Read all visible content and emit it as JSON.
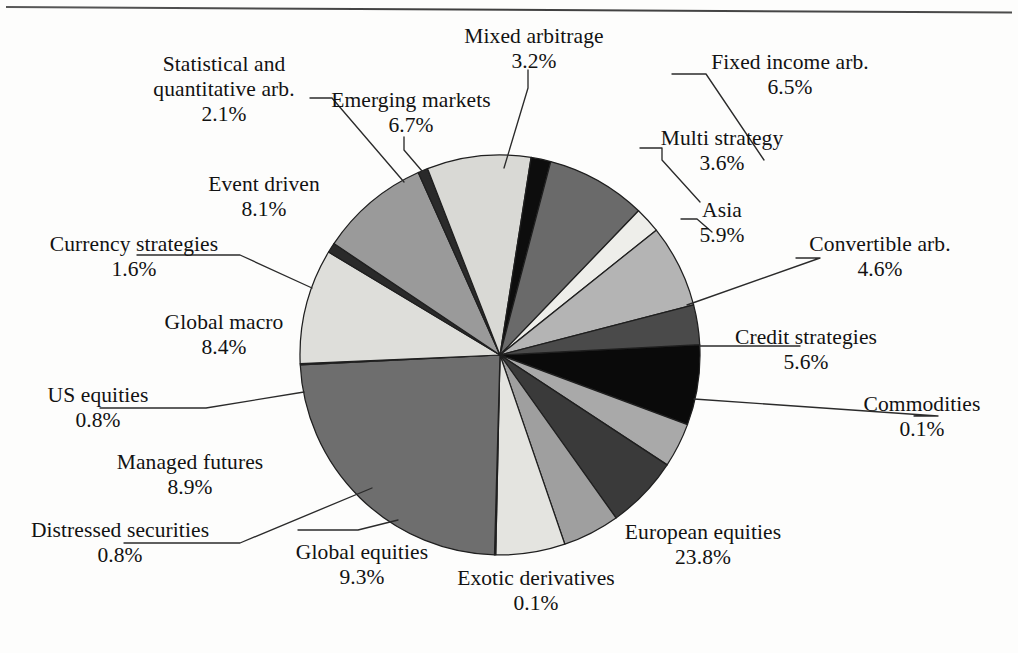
{
  "figure": {
    "type": "pie",
    "background_color": "#fdfdfc",
    "pie_center": [
      500,
      355
    ],
    "pie_radius": 200,
    "has_top_rule": true
  },
  "chart_data": {
    "type": "pie",
    "title": "",
    "xlabel": "",
    "ylabel": "",
    "units": "percent",
    "labels_show_percent": true,
    "legend_position": "callout-labels",
    "grid": false,
    "total": 100.0,
    "start_angle_deg": -3,
    "direction": "clockwise",
    "categories": [
      "Fixed income arb.",
      "Multi strategy",
      "Asia",
      "Convertible arb.",
      "Credit strategies",
      "Commodities",
      "European equities",
      "Exotic derivatives",
      "Global equities",
      "Distressed securities",
      "Managed futures",
      "US equities",
      "Global macro",
      "Currency strategies",
      "Event driven",
      "Statistical and quantitative arb.",
      "Emerging markets",
      "Mixed arbitrage"
    ],
    "values": [
      6.5,
      3.6,
      5.9,
      4.6,
      5.6,
      0.1,
      23.8,
      0.1,
      9.3,
      0.8,
      8.9,
      0.8,
      8.4,
      1.6,
      8.1,
      2.1,
      6.7,
      3.2
    ],
    "colors": [
      "#0a0a0a",
      "#a9a9a9",
      "#3a3a3a",
      "#9f9f9f",
      "#e4e4e0",
      "#ffffff",
      "#6e6e6e",
      "#ffffff",
      "#dededa",
      "#2a2a2a",
      "#9a9a9a",
      "#2a2a2a",
      "#d9d9d5",
      "#0d0d0d",
      "#6a6a6a",
      "#eeeeea",
      "#b4b4b4",
      "#4a4a4a"
    ]
  },
  "slices": [
    {
      "name": "Fixed income arb.",
      "percent_text": "6.5%",
      "label_x": 676,
      "label_y": 52,
      "leader": [
        [
          672,
          74
        ],
        [
          706,
          74
        ],
        [
          764,
          160
        ]
      ]
    },
    {
      "name": "Multi strategy",
      "percent_text": "3.6%",
      "label_x": 648,
      "label_y": 126,
      "leader": [
        [
          640,
          148
        ],
        [
          662,
          148
        ],
        [
          662,
          160
        ],
        [
          700,
          202
        ]
      ]
    },
    {
      "name": "Asia",
      "percent_text": "5.9%",
      "label_x": 690,
      "label_y": 198,
      "leader": [
        [
          681,
          219
        ],
        [
          697,
          219
        ],
        [
          712,
          232
        ]
      ]
    },
    {
      "name": "Convertible arb.",
      "percent_text": "4.6%",
      "label_x": 806,
      "label_y": 232,
      "leader": [
        [
          796,
          258
        ],
        [
          820,
          258
        ],
        [
          687,
          305
        ]
      ]
    },
    {
      "name": "Credit strategies",
      "percent_text": "5.6%",
      "label_x": 806,
      "label_y": 325,
      "leader": [
        [
          800,
          346
        ],
        [
          700,
          346
        ]
      ]
    },
    {
      "name": "Commodities",
      "percent_text": "0.1%",
      "label_x": 922,
      "label_y": 392,
      "leader": [
        [
          914,
          416
        ],
        [
          938,
          416
        ],
        [
          694,
          399
        ]
      ]
    },
    {
      "name": "European equities",
      "percent_text": "23.8%",
      "label_x": 703,
      "label_y": 520,
      "leader": []
    },
    {
      "name": "Exotic derivatives",
      "percent_text": "0.1%",
      "label_x": 445,
      "label_y": 562,
      "leader": []
    },
    {
      "name": "Global equities",
      "percent_text": "9.3%",
      "label_x": 296,
      "label_y": 540,
      "leader": [
        [
          298,
          530
        ],
        [
          358,
          530
        ],
        [
          398,
          520
        ]
      ]
    },
    {
      "name": "Distressed securities",
      "percent_text": "0.8%",
      "label_x": 120,
      "label_y": 518,
      "leader": [
        [
          124,
          543
        ],
        [
          240,
          543
        ],
        [
          372,
          488
        ]
      ]
    },
    {
      "name": "Managed futures",
      "percent_text": "8.9%",
      "label_x": 190,
      "label_y": 450,
      "leader": []
    },
    {
      "name": "US equities",
      "percent_text": "0.8%",
      "label_x": 98,
      "label_y": 383,
      "leader": [
        [
          100,
          408
        ],
        [
          206,
          408
        ],
        [
          304,
          392
        ]
      ]
    },
    {
      "name": "Global macro",
      "percent_text": "8.4%",
      "label_x": 224,
      "label_y": 310,
      "leader": []
    },
    {
      "name": "Currency strategies",
      "percent_text": "1.6%",
      "label_x": 134,
      "label_y": 232,
      "leader": [
        [
          137,
          255
        ],
        [
          240,
          255
        ],
        [
          312,
          288
        ]
      ]
    },
    {
      "name": "Event driven",
      "percent_text": "8.1%",
      "label_x": 264,
      "label_y": 172,
      "leader": []
    },
    {
      "name": "Statistical and quantitative arb.",
      "percent_text": "2.1%",
      "label_x": 224,
      "label_y": 52,
      "leader": [
        [
          310,
          98
        ],
        [
          332,
          98
        ],
        [
          404,
          182
        ]
      ]
    },
    {
      "name": "Emerging markets",
      "percent_text": "6.7%",
      "label_x": 411,
      "label_y": 88,
      "leader": [
        [
          404,
          137
        ],
        [
          404,
          150
        ],
        [
          428,
          178
        ]
      ]
    },
    {
      "name": "Mixed arbitrage",
      "percent_text": "3.2%",
      "label_x": 534,
      "label_y": 24,
      "leader": [
        [
          528,
          70
        ],
        [
          528,
          88
        ],
        [
          504,
          168
        ]
      ]
    }
  ],
  "labels": {
    "fixed_income_arb": {
      "name": "Fixed income arb.",
      "pct": "6.5%"
    },
    "multi_strategy": {
      "name": "Multi strategy",
      "pct": "3.6%"
    },
    "asia": {
      "name": "Asia",
      "pct": "5.9%"
    },
    "convertible_arb": {
      "name": "Convertible arb.",
      "pct": "4.6%"
    },
    "credit_strategies": {
      "name": "Credit strategies",
      "pct": "5.6%"
    },
    "commodities": {
      "name": "Commodities",
      "pct": "0.1%"
    },
    "european_equities": {
      "name": "European equities",
      "pct": "23.8%"
    },
    "exotic_derivatives": {
      "name": "Exotic derivatives",
      "pct": "0.1%"
    },
    "global_equities": {
      "name": "Global equities",
      "pct": "9.3%"
    },
    "distressed_securities": {
      "name": "Distressed securities",
      "pct": "0.8%"
    },
    "managed_futures": {
      "name": "Managed futures",
      "pct": "8.9%"
    },
    "us_equities": {
      "name": "US equities",
      "pct": "0.8%"
    },
    "global_macro": {
      "name": "Global macro",
      "pct": "8.4%"
    },
    "currency_strategies": {
      "name": "Currency strategies",
      "pct": "1.6%"
    },
    "event_driven": {
      "name": "Event driven",
      "pct": "8.1%"
    },
    "statistical_arb": {
      "name_line1": "Statistical and",
      "name_line2": "quantitative arb.",
      "pct": "2.1%"
    },
    "emerging_markets": {
      "name": "Emerging markets",
      "pct": "6.7%"
    },
    "mixed_arbitrage": {
      "name": "Mixed arbitrage",
      "pct": "3.2%"
    }
  }
}
